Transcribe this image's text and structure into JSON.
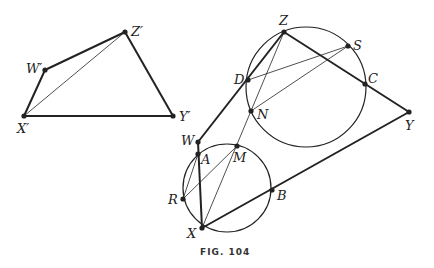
{
  "caption": "FIG. 104",
  "figure_left": {
    "points": {
      "Zp": {
        "label": "Z′",
        "x": 125,
        "y": 32
      },
      "Wp": {
        "label": "W′",
        "x": 45,
        "y": 70
      },
      "Xp": {
        "label": "X′",
        "x": 24,
        "y": 116
      },
      "Yp": {
        "label": "Y′",
        "x": 173,
        "y": 116
      }
    }
  },
  "figure_right": {
    "points": {
      "Z": {
        "label": "Z",
        "x": 284,
        "y": 32
      },
      "S": {
        "label": "S",
        "x": 348,
        "y": 46
      },
      "D": {
        "label": "D",
        "x": 248,
        "y": 80
      },
      "C": {
        "label": "C",
        "x": 365,
        "y": 84
      },
      "N": {
        "label": "N",
        "x": 251,
        "y": 111
      },
      "Y": {
        "label": "Y",
        "x": 409,
        "y": 112
      },
      "W": {
        "label": "W",
        "x": 198,
        "y": 142
      },
      "A": {
        "label": "A",
        "x": 198,
        "y": 154
      },
      "M": {
        "label": "M",
        "x": 237,
        "y": 146
      },
      "R": {
        "label": "R",
        "x": 183,
        "y": 199
      },
      "B": {
        "label": "B",
        "x": 272,
        "y": 190
      },
      "X": {
        "label": "X",
        "x": 202,
        "y": 228
      }
    },
    "circles": [
      {
        "name": "upper-circle",
        "cx": 306,
        "cy": 87,
        "r": 60
      },
      {
        "name": "lower-circle",
        "cx": 227,
        "cy": 188,
        "r": 44
      }
    ]
  }
}
